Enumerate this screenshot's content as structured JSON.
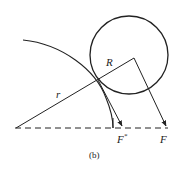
{
  "diagram": {
    "caption": "(b)",
    "labels": {
      "r": "r",
      "R": "R",
      "F_star": "F",
      "F_star_sup": "*",
      "F": "F"
    },
    "colors": {
      "stroke": "#222222",
      "background": "#ffffff"
    },
    "geometry": {
      "origin": [
        16,
        128
      ],
      "circle_center": [
        129,
        55
      ],
      "circle_radius": 39,
      "contact_point": [
        98,
        80
      ],
      "line_vertex": [
        134,
        58
      ],
      "F_star_tip": [
        122,
        127
      ],
      "F_tip": [
        166,
        127
      ],
      "baseline_y": 128
    }
  }
}
